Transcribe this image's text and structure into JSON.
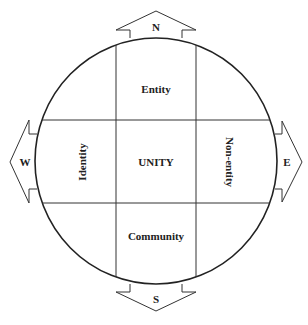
{
  "diagram": {
    "center_label": "UNITY",
    "cells": {
      "north": "Entity",
      "south": "Community",
      "west": "Identity",
      "east": "Non-entity"
    },
    "directions": {
      "north": "N",
      "south": "S",
      "west": "W",
      "east": "E"
    },
    "colors": {
      "stroke": "#222222",
      "background": "#ffffff",
      "text": "#222222"
    }
  }
}
